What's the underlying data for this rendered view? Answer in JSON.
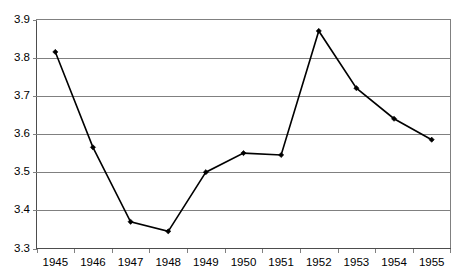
{
  "chart_data": {
    "type": "line",
    "title": "",
    "subtitle": "",
    "xlabel": "",
    "ylabel": "",
    "categories": [
      "1945",
      "1946",
      "1947",
      "1948",
      "1949",
      "1950",
      "1951",
      "1952",
      "1953",
      "1954",
      "1955"
    ],
    "x": [
      1945,
      1946,
      1947,
      1948,
      1949,
      1950,
      1951,
      1952,
      1953,
      1954,
      1955
    ],
    "values": [
      3.815,
      3.565,
      3.37,
      3.345,
      3.5,
      3.55,
      3.545,
      3.87,
      3.72,
      3.64,
      3.585
    ],
    "series": [
      {
        "name": "",
        "values": [
          3.815,
          3.565,
          3.37,
          3.345,
          3.5,
          3.55,
          3.545,
          3.87,
          3.72,
          3.64,
          3.585
        ]
      }
    ],
    "ylim": [
      3.3,
      3.9
    ],
    "ytick_labels": [
      "3.9",
      "3.8",
      "3.7",
      "3.6",
      "3.5",
      "3.4",
      "3.3"
    ],
    "ytick_values": [
      3.9,
      3.8,
      3.7,
      3.6,
      3.5,
      3.4,
      3.3
    ],
    "ytick_step": 0.1,
    "grid": true,
    "grid_axis": "y",
    "legend": false,
    "legend_position": "none",
    "line_color": "#000000",
    "marker_color": "#000000",
    "grid_color": "#808080",
    "frame_color": "#808080",
    "background": "#ffffff",
    "marker": "diamond",
    "annotations": []
  },
  "axes": {
    "y": {
      "ticks": [
        {
          "label": "3.9",
          "value": 3.9
        },
        {
          "label": "3.8",
          "value": 3.8
        },
        {
          "label": "3.7",
          "value": 3.7
        },
        {
          "label": "3.6",
          "value": 3.6
        },
        {
          "label": "3.5",
          "value": 3.5
        },
        {
          "label": "3.4",
          "value": 3.4
        },
        {
          "label": "3.3",
          "value": 3.3
        }
      ]
    },
    "x": {
      "ticks": [
        {
          "label": "1945"
        },
        {
          "label": "1946"
        },
        {
          "label": "1947"
        },
        {
          "label": "1948"
        },
        {
          "label": "1949"
        },
        {
          "label": "1950"
        },
        {
          "label": "1951"
        },
        {
          "label": "1952"
        },
        {
          "label": "1953"
        },
        {
          "label": "1954"
        },
        {
          "label": "1955"
        }
      ]
    }
  }
}
